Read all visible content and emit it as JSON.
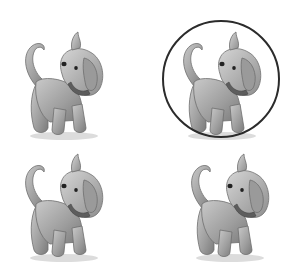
{
  "scene": {
    "subject": "puppy illustration",
    "layout": "2x2 grid",
    "background": "#ffffff",
    "highlight_color": "#2b2b2b",
    "items": [
      {
        "position": "top-left",
        "label": "puppy",
        "circled": false
      },
      {
        "position": "top-right",
        "label": "puppy",
        "circled": true
      },
      {
        "position": "bottom-left",
        "label": "puppy",
        "circled": false
      },
      {
        "position": "bottom-right",
        "label": "puppy",
        "circled": false
      }
    ]
  }
}
